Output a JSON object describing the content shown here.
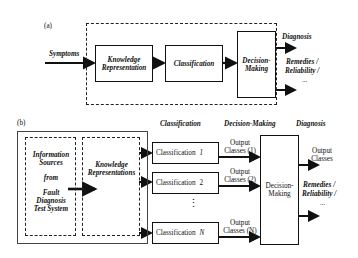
{
  "panel_a": {
    "label": "(a)",
    "input": "Symptoms",
    "blocks": [
      {
        "line1": "Knowledge",
        "line2": "Representation"
      },
      {
        "line1": "Classification",
        "line2": ""
      },
      {
        "line1": "Decision-",
        "line2": "Making"
      }
    ],
    "outputs": {
      "top": "Diagnosis",
      "mid1": "Remedies /",
      "mid2": "Reliability /",
      "ellipsis": "..."
    }
  },
  "panel_b": {
    "label": "(b)",
    "info_sources": [
      "Information",
      "Sources",
      "from",
      "Fault",
      "Diagnosis",
      "Test System"
    ],
    "knowledge": [
      "Knowledge",
      "Representations"
    ],
    "headers": {
      "classification": "Classification",
      "decision": "Decision-Making",
      "diagnosis": "Diagnosis"
    },
    "classifiers": [
      {
        "label": "Classification",
        "index": "1",
        "out1": "Output",
        "out2": "Classes (1)"
      },
      {
        "label": "Classification",
        "index": "2",
        "out1": "Output",
        "out2": "Classes (2)"
      },
      {
        "label": "Classification",
        "index": "N",
        "out1": "Output",
        "out2": "Classes (N)"
      }
    ],
    "vertical_ellipsis": "⋮",
    "decision": {
      "line1": "Decision-",
      "line2": "Making"
    },
    "outputs": {
      "classes1": "Output",
      "classes2": "Classes",
      "mid1": "Remedies /",
      "mid2": "Reliability /",
      "ellipsis": "..."
    }
  }
}
